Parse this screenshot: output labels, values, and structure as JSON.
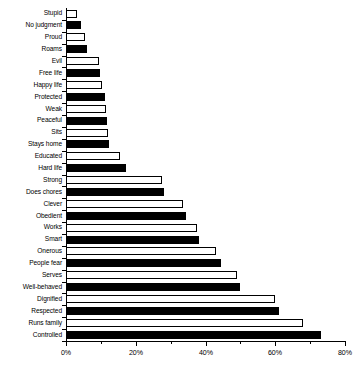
{
  "chart_data": {
    "type": "bar",
    "orientation": "horizontal",
    "title": "",
    "subtitle": "",
    "xlabel": "",
    "ylabel": "",
    "xlim": [
      0,
      80
    ],
    "grid": false,
    "legend": null,
    "x_tick_labels": [
      "0%",
      "20%",
      "40%",
      "60%",
      "80%"
    ],
    "x_tick_values": [
      0,
      20,
      40,
      60,
      80
    ],
    "x_minor_tick_values": [
      10,
      30,
      50,
      70
    ],
    "bar_colors": {
      "odd": "#ffffff",
      "even": "#000000",
      "edge": "#000000"
    },
    "categories": [
      "Stupid",
      "No judgment",
      "Proud",
      "Roams",
      "Evil",
      "Free life",
      "Happy life",
      "Protected",
      "Weak",
      "Peaceful",
      "Sits",
      "Stays home",
      "Educated",
      "Hard life",
      "Strong",
      "Does chores",
      "Clever",
      "Obedient",
      "Works",
      "Smart",
      "Onerous",
      "People fear",
      "Serves",
      "Well-behaved",
      "Dignified",
      "Respected",
      "Runs family",
      "Controlled"
    ],
    "values": [
      3.2,
      4.3,
      5.4,
      6.0,
      9.4,
      9.7,
      10.3,
      11.2,
      11.4,
      11.7,
      12.0,
      12.3,
      15.5,
      17.2,
      27.5,
      28.1,
      33.6,
      34.4,
      37.5,
      38.1,
      43.0,
      44.4,
      49.0,
      50.0,
      60.0,
      61.0,
      68.0,
      73.0
    ],
    "fills": [
      "white",
      "black",
      "white",
      "black",
      "white",
      "black",
      "white",
      "black",
      "white",
      "black",
      "white",
      "black",
      "white",
      "black",
      "white",
      "black",
      "white",
      "black",
      "white",
      "black",
      "white",
      "black",
      "white",
      "black",
      "white",
      "black",
      "white",
      "black"
    ]
  }
}
